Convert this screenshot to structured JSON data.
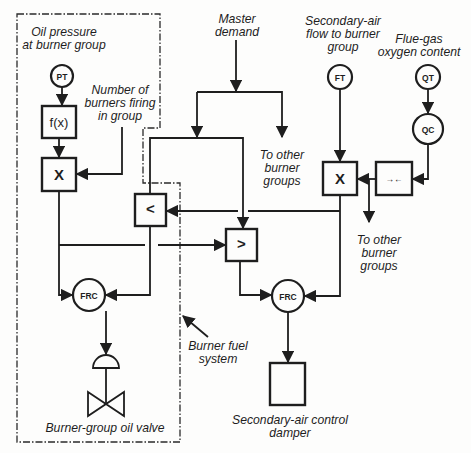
{
  "diagram": {
    "labels": {
      "oil_pressure_line1": "Oil pressure",
      "oil_pressure_line2": "at burner group",
      "num_burners_line1": "Number of",
      "num_burners_line2": "burners firing",
      "num_burners_line3": "in group",
      "master_demand_line1": "Master",
      "master_demand_line2": "demand",
      "secondary_air_line1": "Secondary-air",
      "secondary_air_line2": "flow to burner",
      "secondary_air_line3": "group",
      "flue_gas_line1": "Flue-gas",
      "flue_gas_line2": "oxygen content",
      "other_groups_1_line1": "To other",
      "other_groups_1_line2": "burner",
      "other_groups_1_line3": "groups",
      "other_groups_2_line1": "To other",
      "other_groups_2_line2": "burner",
      "other_groups_2_line3": "groups",
      "burner_fuel_line1": "Burner fuel",
      "burner_fuel_line2": "system",
      "oil_valve": "Burner-group oil valve",
      "damper_line1": "Secondary-air control",
      "damper_line2": "damper"
    },
    "instruments": {
      "pressure_transmitter": "PT",
      "flow_transmitter": "FT",
      "quality_transmitter": "QT",
      "quality_controller": "QC",
      "fuel_flow_controller": "FRC",
      "air_flow_controller": "FRC"
    },
    "function_blocks": {
      "characterizer": "f(x)",
      "fuel_multiplier": "X",
      "low_selector": "<",
      "high_selector": ">",
      "air_multiplier": "X",
      "bias_ratio": "→←"
    },
    "colors": {
      "line": "#1e1e1e",
      "background": "#fdfdfc"
    }
  }
}
